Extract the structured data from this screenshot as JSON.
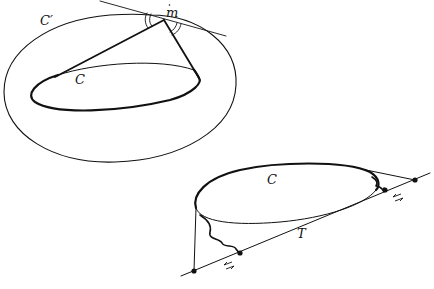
{
  "figure_top": {
    "labels": {
      "outer_curve": "C′",
      "inner_curve": "C",
      "point": "m"
    }
  },
  "figure_bottom": {
    "labels": {
      "curve": "C",
      "tangent_line": "T"
    }
  },
  "colors": {
    "stroke": "#111111",
    "background": "#ffffff"
  }
}
